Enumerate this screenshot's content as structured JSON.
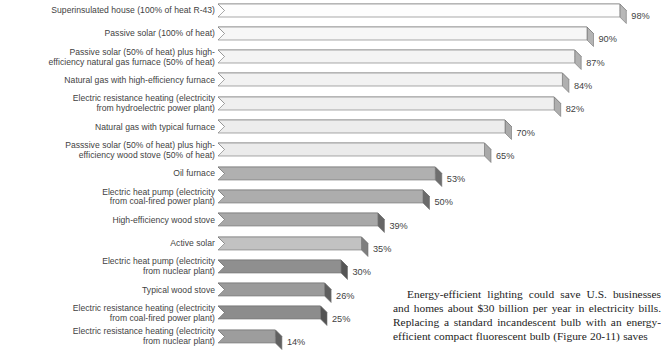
{
  "chart_data": {
    "type": "bar",
    "orientation": "horizontal",
    "title": "",
    "xlabel": "",
    "ylabel": "",
    "xlim": [
      0,
      100
    ],
    "grid": false,
    "legend": false,
    "value_suffix": "%",
    "categories": [
      "Superinsulated house (100% of heat R-43)",
      "Passive solar (100% of heat)",
      "Passive solar (50% of heat) plus high-\nefficiency natural gas furnace (50% of heat)",
      "Natural gas with high-efficiency furnace",
      "Electric resistance heating (electricity\nfrom hydroelectric power plant)",
      "Natural gas with typical furnace",
      "Passsive solar (50% of heat) plus high-\nefficiency wood stove (50% of heat)",
      "Oil furnace",
      "Electric heat pump (electricity\nfrom coal-fired power plant)",
      "High-efficiency wood stove",
      "Active solar",
      "Electric heat pump (electricity\nfrom nuclear plant)",
      "Typical wood stove",
      "Electric resistance heating (electricity\nfrom coal-fired power plant)",
      "Electric resistance heating (electricity\nfrom nuclear plant)"
    ],
    "values": [
      98,
      90,
      87,
      84,
      82,
      70,
      65,
      53,
      50,
      39,
      35,
      30,
      26,
      25,
      14
    ],
    "value_labels": [
      "98%",
      "90%",
      "87%",
      "84%",
      "82%",
      "70%",
      "65%",
      "53%",
      "50%",
      "39%",
      "35%",
      "30%",
      "26%",
      "25%",
      "14%"
    ],
    "bar_colors": [
      "#fdfdfd",
      "#f7f7f7",
      "#f4f4f4",
      "#f2f2f2",
      "#efefef",
      "#ededed",
      "#ebebeb",
      "#b0b0b0",
      "#adadad",
      "#a8a8a8",
      "#c2c2c2",
      "#8f8f8f",
      "#9a9a9a",
      "#8c8c8c",
      "#9d9d9d"
    ],
    "top_face_colors": [
      "#e8e8e8",
      "#e2e2e2",
      "#e0e0e0",
      "#dedede",
      "#dcdcdc",
      "#dadada",
      "#d8d8d8",
      "#9c9c9c",
      "#999999",
      "#949494",
      "#b0b0b0",
      "#7d7d7d",
      "#888888",
      "#7a7a7a",
      "#8a8a8a"
    ],
    "cap_colors": [
      "#b8b8b8",
      "#b4b4b4",
      "#b2b2b2",
      "#b0b0b0",
      "#aeaeae",
      "#ababab",
      "#a9a9a9",
      "#6e6e6e",
      "#6b6b6b",
      "#666666",
      "#7e7e7e",
      "#555555",
      "#5e5e5e",
      "#535353",
      "#616161"
    ],
    "outline_color": "#707070"
  },
  "body_text": {
    "paragraph": "Energy-efficient lighting could save U.S. businesses and homes about $30 billion per year in electricity bills. Replacing a standard incandescent bulb with an energy-efficient compact fluorescent bulb (Figure 20-11) saves"
  }
}
